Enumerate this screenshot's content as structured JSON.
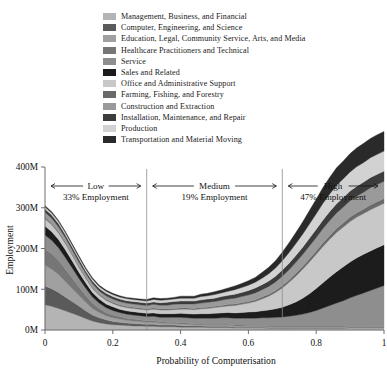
{
  "chart_data": {
    "type": "area",
    "stacked": true,
    "title": "",
    "xlabel": "Probability of Computerisation",
    "ylabel": "Employment",
    "xlim": [
      0,
      1
    ],
    "ylim": [
      0,
      400
    ],
    "y_unit": "M",
    "grid": false,
    "legend_position": "top",
    "xticks": [
      "0",
      "0.2",
      "0.4",
      "0.6",
      "0.8",
      "1"
    ],
    "xtick_values": [
      0,
      0.2,
      0.4,
      0.6,
      0.8,
      1
    ],
    "yticks": [
      "0M",
      "100M",
      "200M",
      "300M",
      "400M"
    ],
    "ytick_values": [
      0,
      100,
      200,
      300,
      400
    ],
    "x": [
      0.0,
      0.02,
      0.04,
      0.06,
      0.08,
      0.1,
      0.12,
      0.14,
      0.16,
      0.18,
      0.2,
      0.22,
      0.24,
      0.26,
      0.28,
      0.3,
      0.32,
      0.34,
      0.36,
      0.38,
      0.4,
      0.42,
      0.44,
      0.46,
      0.48,
      0.5,
      0.52,
      0.54,
      0.56,
      0.58,
      0.6,
      0.62,
      0.64,
      0.66,
      0.68,
      0.7,
      0.72,
      0.74,
      0.76,
      0.78,
      0.8,
      0.82,
      0.84,
      0.86,
      0.88,
      0.9,
      0.92,
      0.94,
      0.96,
      0.98,
      1.0
    ],
    "series": [
      {
        "name": "Management, Business, and Financial",
        "color": "#b4b4b4",
        "values": [
          62,
          58,
          53,
          47,
          41,
          35,
          28,
          22,
          18,
          15,
          13,
          12,
          11,
          10,
          10,
          9,
          9,
          8,
          8,
          8,
          7,
          7,
          7,
          7,
          6,
          6,
          6,
          6,
          5,
          5,
          5,
          5,
          5,
          4,
          4,
          4,
          4,
          4,
          4,
          4,
          4,
          4,
          4,
          4,
          4,
          5,
          5,
          5,
          5,
          5,
          5
        ]
      },
      {
        "name": "Computer, Engineering, and Science",
        "color": "#5a5a5a",
        "values": [
          46,
          43,
          39,
          34,
          29,
          24,
          19,
          15,
          12,
          10,
          8,
          7,
          6,
          6,
          5,
          5,
          5,
          4,
          4,
          4,
          4,
          3,
          3,
          3,
          3,
          3,
          3,
          3,
          2,
          2,
          2,
          2,
          2,
          2,
          2,
          2,
          2,
          2,
          2,
          2,
          2,
          2,
          2,
          2,
          2,
          2,
          2,
          2,
          2,
          2,
          2
        ]
      },
      {
        "name": "Education, Legal, Community Service, Arts, and Media",
        "color": "#a0a0a0",
        "values": [
          51,
          48,
          44,
          38,
          32,
          26,
          21,
          16,
          13,
          10,
          9,
          8,
          7,
          6,
          6,
          5,
          5,
          5,
          4,
          4,
          4,
          4,
          3,
          3,
          3,
          3,
          3,
          3,
          3,
          3,
          2,
          2,
          2,
          2,
          2,
          2,
          2,
          2,
          2,
          2,
          2,
          2,
          2,
          2,
          2,
          2,
          2,
          2,
          2,
          2,
          2
        ]
      },
      {
        "name": "Healthcare Practitioners and Technical",
        "color": "#767676",
        "values": [
          40,
          38,
          35,
          31,
          26,
          21,
          17,
          13,
          10,
          8,
          7,
          6,
          5,
          5,
          4,
          4,
          4,
          3,
          3,
          3,
          3,
          3,
          2,
          2,
          2,
          2,
          2,
          2,
          2,
          2,
          2,
          2,
          2,
          2,
          2,
          2,
          2,
          2,
          2,
          2,
          2,
          2,
          2,
          2,
          2,
          2,
          2,
          2,
          2,
          2,
          2
        ]
      },
      {
        "name": "Service",
        "color": "#8e8e8e",
        "values": [
          34,
          33,
          31,
          28,
          25,
          21,
          18,
          15,
          13,
          12,
          11,
          10,
          10,
          10,
          10,
          10,
          11,
          11,
          12,
          12,
          13,
          13,
          14,
          14,
          15,
          15,
          16,
          16,
          17,
          17,
          18,
          18,
          19,
          20,
          21,
          22,
          24,
          26,
          29,
          33,
          38,
          44,
          50,
          56,
          62,
          68,
          74,
          80,
          86,
          92,
          98
        ]
      },
      {
        "name": "Sales and Related",
        "color": "#1c1c1c",
        "values": [
          22,
          21,
          20,
          19,
          17,
          15,
          13,
          11,
          10,
          9,
          9,
          8,
          8,
          8,
          8,
          8,
          8,
          9,
          9,
          9,
          10,
          10,
          10,
          11,
          11,
          12,
          12,
          13,
          13,
          14,
          15,
          16,
          17,
          19,
          21,
          24,
          28,
          33,
          39,
          46,
          54,
          62,
          70,
          77,
          83,
          88,
          92,
          95,
          97,
          99,
          100
        ]
      },
      {
        "name": "Office and Administrative Support",
        "color": "#c8c8c8",
        "values": [
          18,
          17,
          16,
          15,
          14,
          12,
          11,
          10,
          9,
          9,
          8,
          8,
          8,
          8,
          8,
          8,
          9,
          9,
          9,
          10,
          10,
          11,
          11,
          12,
          13,
          14,
          15,
          16,
          18,
          20,
          22,
          25,
          29,
          34,
          40,
          47,
          55,
          63,
          71,
          78,
          84,
          89,
          93,
          96,
          98,
          99,
          100,
          100,
          101,
          101,
          102
        ]
      },
      {
        "name": "Farming, Fishing, and Forestry",
        "color": "#6a6a6a",
        "values": [
          4,
          4,
          4,
          4,
          3,
          3,
          3,
          3,
          3,
          3,
          3,
          3,
          3,
          3,
          3,
          3,
          3,
          3,
          3,
          3,
          3,
          3,
          3,
          3,
          3,
          3,
          3,
          4,
          4,
          4,
          4,
          4,
          5,
          5,
          5,
          6,
          6,
          7,
          7,
          8,
          8,
          9,
          9,
          10,
          10,
          11,
          11,
          11,
          12,
          12,
          12
        ]
      },
      {
        "name": "Construction and Extraction",
        "color": "#9a9a9a",
        "values": [
          12,
          12,
          11,
          11,
          10,
          10,
          9,
          9,
          8,
          8,
          8,
          8,
          8,
          8,
          8,
          8,
          9,
          9,
          9,
          10,
          10,
          10,
          11,
          11,
          12,
          12,
          13,
          13,
          14,
          15,
          16,
          17,
          18,
          19,
          21,
          23,
          25,
          27,
          29,
          31,
          33,
          35,
          37,
          38,
          39,
          40,
          41,
          41,
          42,
          42,
          42
        ]
      },
      {
        "name": "Installation, Maintenance, and Repair",
        "color": "#3c3c3c",
        "values": [
          8,
          8,
          8,
          7,
          7,
          7,
          6,
          6,
          6,
          6,
          6,
          6,
          6,
          6,
          6,
          6,
          6,
          6,
          7,
          7,
          7,
          7,
          7,
          8,
          8,
          8,
          9,
          9,
          10,
          10,
          11,
          12,
          12,
          13,
          14,
          15,
          16,
          17,
          18,
          19,
          20,
          21,
          22,
          23,
          23,
          24,
          24,
          25,
          25,
          25,
          25
        ]
      },
      {
        "name": "Production",
        "color": "#d2d2d2",
        "values": [
          5,
          5,
          5,
          5,
          5,
          5,
          5,
          5,
          5,
          5,
          5,
          5,
          5,
          5,
          5,
          5,
          6,
          6,
          6,
          6,
          7,
          7,
          7,
          8,
          8,
          9,
          9,
          10,
          11,
          12,
          13,
          14,
          16,
          18,
          20,
          23,
          26,
          29,
          32,
          35,
          38,
          41,
          43,
          45,
          46,
          47,
          48,
          48,
          49,
          49,
          49
        ]
      },
      {
        "name": "Transportation and Material Moving",
        "color": "#2a2a2a",
        "values": [
          3,
          3,
          3,
          3,
          3,
          3,
          3,
          3,
          3,
          3,
          3,
          3,
          3,
          3,
          3,
          4,
          4,
          4,
          4,
          4,
          5,
          5,
          5,
          6,
          6,
          7,
          7,
          8,
          9,
          10,
          11,
          12,
          14,
          16,
          18,
          21,
          24,
          27,
          30,
          33,
          36,
          39,
          41,
          43,
          44,
          45,
          46,
          47,
          47,
          48,
          48
        ]
      }
    ],
    "annotations": [
      {
        "id": "low",
        "label": "Low",
        "sublabel": "33% Employment",
        "x_start": 0.0,
        "x_end": 0.3
      },
      {
        "id": "medium",
        "label": "Medium",
        "sublabel": "19% Employment",
        "x_start": 0.3,
        "x_end": 0.7
      },
      {
        "id": "high",
        "label": "High",
        "sublabel": "47% Employment",
        "x_start": 0.7,
        "x_end": 1.0
      }
    ],
    "dividers": [
      0.3,
      0.7
    ]
  },
  "legend": {
    "items": [
      {
        "label": "Management, Business, and Financial",
        "color": "#b4b4b4"
      },
      {
        "label": "Computer, Engineering, and Science",
        "color": "#5a5a5a"
      },
      {
        "label": "Education, Legal, Community Service, Arts, and Media",
        "color": "#a0a0a0"
      },
      {
        "label": "Healthcare Practitioners and Technical",
        "color": "#767676"
      },
      {
        "label": "Service",
        "color": "#8e8e8e"
      },
      {
        "label": "Sales and Related",
        "color": "#1c1c1c"
      },
      {
        "label": "Office and Administrative Support",
        "color": "#c8c8c8"
      },
      {
        "label": "Farming, Fishing, and Forestry",
        "color": "#6a6a6a"
      },
      {
        "label": "Construction and Extraction",
        "color": "#9a9a9a"
      },
      {
        "label": "Installation, Maintenance, and Repair",
        "color": "#3c3c3c"
      },
      {
        "label": "Production",
        "color": "#d2d2d2"
      },
      {
        "label": "Transportation and Material Moving",
        "color": "#2a2a2a"
      }
    ]
  },
  "axes": {
    "y_title": "Employment",
    "x_title": "Probability of Computerisation",
    "y_ticks": [
      "400M",
      "300M",
      "200M",
      "100M",
      "0M"
    ],
    "x_ticks": [
      "0",
      "0.2",
      "0.4",
      "0.6",
      "0.8",
      "1"
    ]
  },
  "regions": {
    "low": {
      "label": "Low",
      "value": "33% Employment"
    },
    "medium": {
      "label": "Medium",
      "value": "19% Employment"
    },
    "high": {
      "label": "High",
      "value": "47% Employment"
    }
  }
}
